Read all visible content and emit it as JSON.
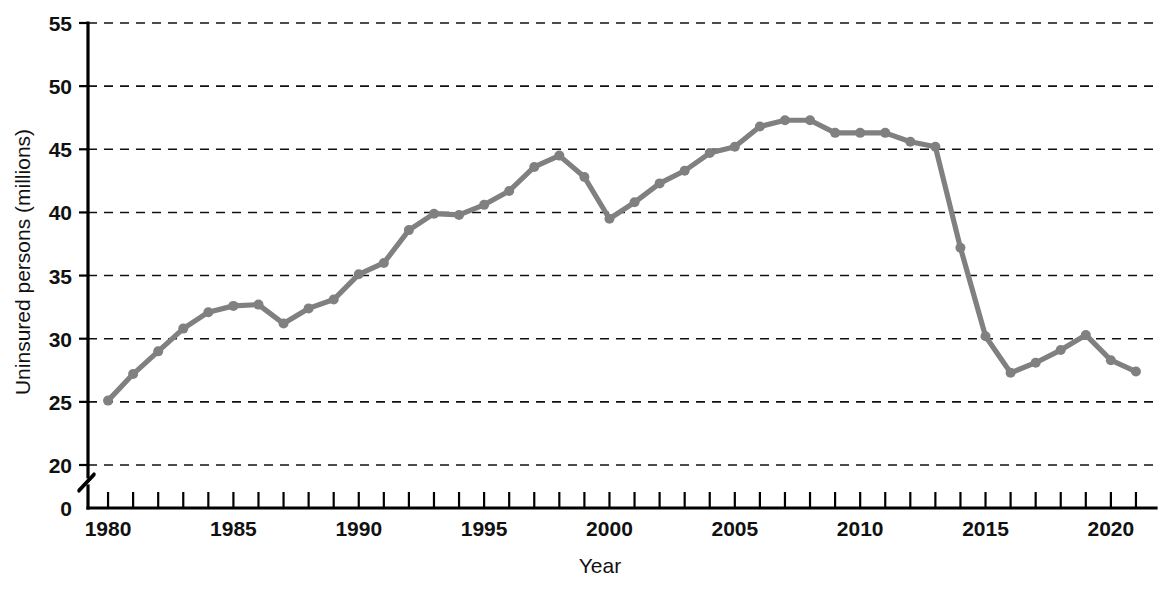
{
  "chart_data": {
    "type": "line",
    "title": "",
    "xlabel": "Year",
    "ylabel": "Uninsured persons (millions)",
    "xlim": [
      1979.2,
      2021.8
    ],
    "ylim": [
      20,
      55
    ],
    "y_axis_break": true,
    "y_axis_zero_label": "0",
    "grid": "horizontal-dashed",
    "legend": "none",
    "series_color": "#808080",
    "y_ticks": [
      20,
      25,
      30,
      35,
      40,
      45,
      50,
      55
    ],
    "y_tick_labels": [
      "20",
      "25",
      "30",
      "35",
      "40",
      "45",
      "50",
      "55"
    ],
    "x_ticks": [
      1980,
      1981,
      1982,
      1983,
      1984,
      1985,
      1986,
      1987,
      1988,
      1989,
      1990,
      1991,
      1992,
      1993,
      1994,
      1995,
      1996,
      1997,
      1998,
      1999,
      2000,
      2001,
      2002,
      2003,
      2004,
      2005,
      2006,
      2007,
      2008,
      2009,
      2010,
      2011,
      2012,
      2013,
      2014,
      2015,
      2016,
      2017,
      2018,
      2019,
      2020,
      2021
    ],
    "x_tick_labels": [
      {
        "value": 1980,
        "label": "1980"
      },
      {
        "value": 1985,
        "label": "1985"
      },
      {
        "value": 1990,
        "label": "1990"
      },
      {
        "value": 1995,
        "label": "1995"
      },
      {
        "value": 2000,
        "label": "2000"
      },
      {
        "value": 2005,
        "label": "2005"
      },
      {
        "value": 2010,
        "label": "2010"
      },
      {
        "value": 2015,
        "label": "2015"
      },
      {
        "value": 2020,
        "label": "2020"
      }
    ],
    "x": [
      1980,
      1981,
      1982,
      1983,
      1984,
      1985,
      1986,
      1987,
      1988,
      1989,
      1990,
      1991,
      1992,
      1993,
      1994,
      1995,
      1996,
      1997,
      1998,
      1999,
      2000,
      2001,
      2002,
      2003,
      2004,
      2005,
      2006,
      2007,
      2008,
      2009,
      2010,
      2011,
      2012,
      2013,
      2014,
      2015,
      2016,
      2017,
      2018,
      2019,
      2020,
      2021
    ],
    "values": [
      25.1,
      27.2,
      29.0,
      30.8,
      32.1,
      32.6,
      32.7,
      31.2,
      32.4,
      33.1,
      35.1,
      36.0,
      38.6,
      39.9,
      39.8,
      40.6,
      41.7,
      43.6,
      44.5,
      42.8,
      39.5,
      40.8,
      42.3,
      43.3,
      44.7,
      45.2,
      46.8,
      47.3,
      47.3,
      46.3,
      46.3,
      46.3,
      45.6,
      45.2,
      37.2,
      30.2,
      27.3,
      28.1,
      29.1,
      30.3,
      28.3,
      27.4
    ]
  }
}
